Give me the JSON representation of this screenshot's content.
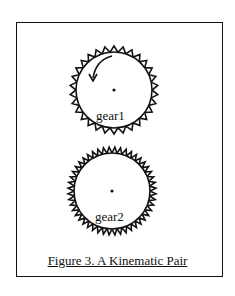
{
  "figure": {
    "caption": "Figure 3. A Kinematic Pair",
    "gears": [
      {
        "label": "gear1",
        "cx": 114,
        "cy": 90,
        "r": 38,
        "teeth": 30,
        "tooth_h": 6,
        "rotation": "counter-clockwise"
      },
      {
        "label": "gear2",
        "cx": 112,
        "cy": 191,
        "r": 38,
        "teeth": 48,
        "tooth_h": 6
      }
    ],
    "colors": {
      "stroke": "#111111",
      "background": "#ffffff"
    }
  }
}
